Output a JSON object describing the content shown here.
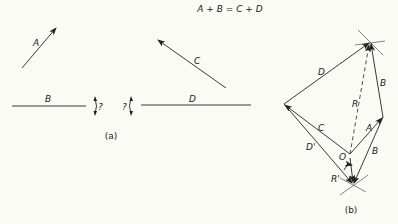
{
  "equation": "A + B = C + D",
  "part_a": {
    "caption": "(a)",
    "vectors": [
      {
        "name": "A",
        "label": "A",
        "from": [
          22,
          68
        ],
        "to": [
          56,
          28
        ],
        "arrow": true
      },
      {
        "name": "B",
        "label": "B",
        "from": [
          12,
          106
        ],
        "to": [
          86,
          106
        ],
        "arrow": false
      },
      {
        "name": "C",
        "label": "C",
        "from": [
          226,
          88
        ],
        "to": [
          158,
          40
        ],
        "arrow": true
      },
      {
        "name": "D",
        "label": "D",
        "from": [
          141,
          105
        ],
        "to": [
          251,
          105
        ],
        "arrow": false
      }
    ],
    "unknown_direction_marks": [
      {
        "label": "?",
        "x": 96
      },
      {
        "label": "?",
        "x": 130
      }
    ]
  },
  "part_b": {
    "caption": "(b)",
    "points": {
      "top": [
        370,
        42
      ],
      "left": [
        284,
        104
      ],
      "right": [
        383,
        117
      ],
      "O": [
        350,
        154
      ],
      "bottom": [
        353,
        184
      ]
    },
    "labels": {
      "D": "D",
      "B": "B",
      "R": "R",
      "A": "A",
      "C": "C",
      "D_prime": "D'",
      "B_lower": "B",
      "O": "O",
      "R_prime": "R'"
    }
  }
}
